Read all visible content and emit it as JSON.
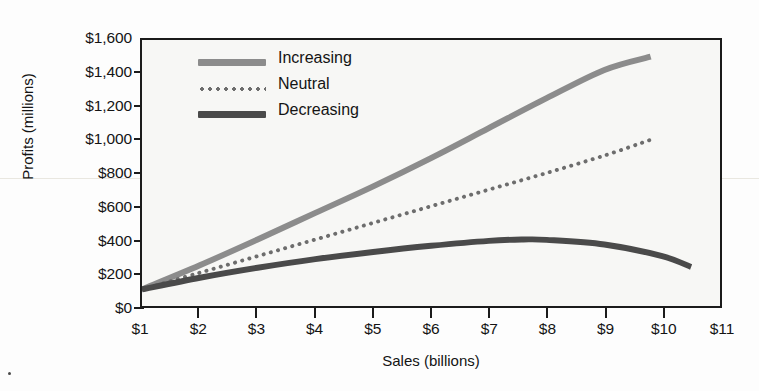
{
  "chart_data": {
    "type": "line",
    "title": "",
    "xlabel": "Sales (billions)",
    "ylabel": "Profits (millions)",
    "xlim": [
      1,
      11
    ],
    "ylim": [
      0,
      1600
    ],
    "xticks": [
      "$1",
      "$2",
      "$3",
      "$4",
      "$5",
      "$6",
      "$7",
      "$8",
      "$9",
      "$10",
      "$11"
    ],
    "xtick_values": [
      1,
      2,
      3,
      4,
      5,
      6,
      7,
      8,
      9,
      10,
      11
    ],
    "yticks": [
      "$0",
      "$200",
      "$400",
      "$600",
      "$800",
      "$1,000",
      "$1,200",
      "$1,400",
      "$1,600"
    ],
    "ytick_values": [
      0,
      200,
      400,
      600,
      800,
      1000,
      1200,
      1400,
      1600
    ],
    "grid": false,
    "legend_position": "upper-left-inside",
    "series": [
      {
        "name": "Increasing",
        "style": "solid",
        "color": "#8c8c8c",
        "width": 6,
        "x": [
          1,
          2,
          3,
          4,
          5,
          6,
          7,
          8,
          9,
          9.8
        ],
        "values": [
          100,
          245,
          400,
          560,
          720,
          890,
          1070,
          1250,
          1420,
          1500
        ]
      },
      {
        "name": "Neutral",
        "style": "dotted",
        "color": "#6d6d6d",
        "width": 4,
        "x": [
          1,
          2,
          3,
          4,
          5,
          6,
          7,
          8,
          9,
          9.8
        ],
        "values": [
          100,
          200,
          300,
          400,
          500,
          600,
          700,
          800,
          905,
          1000
        ]
      },
      {
        "name": "Decreasing",
        "style": "solid",
        "color": "#4a4a4a",
        "width": 6,
        "x": [
          1,
          2,
          3,
          4,
          5,
          6,
          7,
          7.6,
          8,
          9,
          10,
          10.5
        ],
        "values": [
          100,
          170,
          230,
          282,
          325,
          362,
          392,
          400,
          398,
          370,
          300,
          235
        ]
      }
    ]
  },
  "legend": {
    "items": [
      {
        "label": "Increasing",
        "swatch": "solid-thick",
        "color": "#8c8c8c"
      },
      {
        "label": "Neutral",
        "swatch": "dotted",
        "color": "#6d6d6d"
      },
      {
        "label": "Decreasing",
        "swatch": "solid-thick",
        "color": "#4a4a4a"
      }
    ]
  }
}
